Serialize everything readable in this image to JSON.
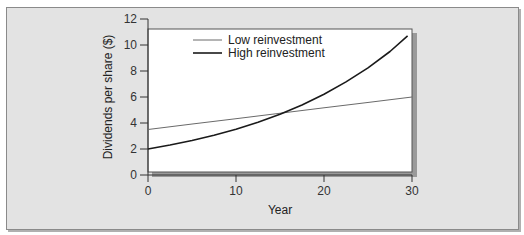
{
  "chart_data": {
    "type": "line",
    "title": "",
    "xlabel": "Year",
    "ylabel": "Dividends per share ($)",
    "xlim": [
      0,
      30
    ],
    "ylim": [
      0,
      12
    ],
    "xticks": [
      0,
      10,
      20,
      30
    ],
    "yticks": [
      0,
      2,
      4,
      6,
      8,
      10,
      12
    ],
    "grid": false,
    "legend_position": "top-left",
    "series": [
      {
        "name": "Low reinvestment",
        "color": "#6a6a6a",
        "x": [
          0,
          5,
          10,
          15,
          20,
          25,
          30
        ],
        "y": [
          3.5,
          3.92,
          4.33,
          4.75,
          5.17,
          5.58,
          6.0
        ]
      },
      {
        "name": "High reinvestment",
        "color": "#1a1a1a",
        "x": [
          0,
          2.5,
          5,
          7.5,
          10,
          12.5,
          15,
          17.5,
          20,
          22.5,
          25,
          27.5,
          29.5
        ],
        "y": [
          2.0,
          2.31,
          2.66,
          3.06,
          3.52,
          4.06,
          4.68,
          5.39,
          6.21,
          7.16,
          8.24,
          9.5,
          10.7
        ]
      }
    ]
  }
}
